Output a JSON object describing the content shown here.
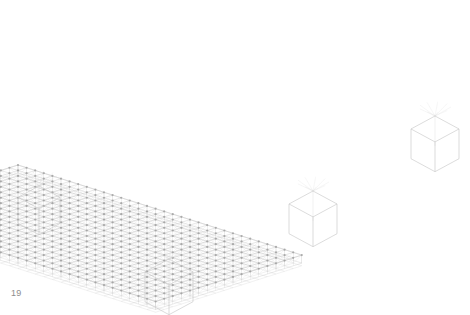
{
  "page": {
    "background_color": "#ffffff",
    "width": 470,
    "height": 315
  },
  "figure_label": {
    "text": "19",
    "color": "#8d8d8d"
  },
  "diagram": {
    "name": "space-truss-isometric-wireframe",
    "kind": "3d-wireframe-structural-model",
    "line_colors": {
      "top_chord": "#bcbcbc",
      "bottom_chord": "#cfcfcf",
      "web_diagonal": "#dadada",
      "node": "#9a9a9a",
      "support_cube": "#c4c4c4",
      "edge_fascia": "#c9c9c9"
    },
    "projection": {
      "type": "isometric",
      "u_axis_dx": 8.6,
      "u_axis_dy": 2.73,
      "v_axis_dx": -8.6,
      "v_axis_dy": 2.73,
      "depth_dy": 8.0
    },
    "grid": {
      "bays_u": 33,
      "bays_v": 17,
      "node_marker_size": 1.1
    },
    "plan_corners": {
      "top": [
        300,
        13
      ],
      "right": [
        450,
        103
      ],
      "bottom": [
        168,
        255
      ],
      "left": [
        18,
        165
      ]
    },
    "supports": [
      {
        "name": "support-left",
        "x": 18,
        "y": 186,
        "size": 42
      },
      {
        "name": "support-bottom",
        "x": 145,
        "y": 259,
        "size": 48
      },
      {
        "name": "support-right-mid",
        "x": 289,
        "y": 191,
        "size": 48
      },
      {
        "name": "support-far-right",
        "x": 411,
        "y": 116,
        "size": 48
      }
    ],
    "support_hubs": [
      {
        "name": "hub-left",
        "x": 41,
        "y": 176
      },
      {
        "name": "hub-bottom",
        "x": 169,
        "y": 250
      },
      {
        "name": "hub-right-mid",
        "x": 313,
        "y": 182
      },
      {
        "name": "hub-far-right",
        "x": 435,
        "y": 107
      }
    ]
  }
}
